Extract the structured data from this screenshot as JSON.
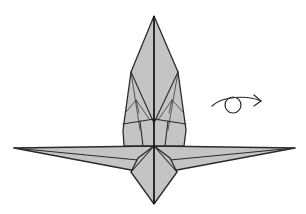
{
  "diagram": {
    "description": "Crane-like origami base with pointed head, spread wings and tail; turn-over symbol to the right",
    "colors": {
      "paper": "#c4c4c4",
      "line": "#2a2a2a",
      "background": "#ffffff"
    },
    "symbols": [
      {
        "name": "turn-over-symbol",
        "meaning": "turn the model over"
      }
    ]
  }
}
